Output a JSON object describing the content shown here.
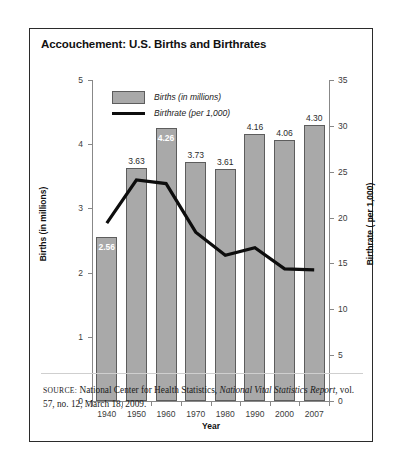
{
  "figure": {
    "title": "Accouchement: U.S. Births and Birthrates",
    "source_kicker": "SOURCE:",
    "source_text_1": " National Center for Health Statistics, ",
    "source_italic": "National Vital Statistics Report",
    "source_text_2": ", vol. 57, no. 12, March 18, 2009."
  },
  "legend": {
    "bars_label": "Births (in millions)",
    "line_label": "Birthrate (per 1,000)",
    "bar_color": "#a9a9a9",
    "bar_border_color": "#5d5d5d",
    "line_color": "#0d0d0d"
  },
  "chart_data": {
    "type": "bar",
    "title": "Accouchement: U.S. Births and Birthrates",
    "xlabel": "Year",
    "ylabel": "Births (in millions)",
    "y2label": "Birthrate ( per 1,000)",
    "categories": [
      "1940",
      "1950",
      "1960",
      "1970",
      "1980",
      "1990",
      "2000",
      "2007"
    ],
    "ylim": [
      0,
      5
    ],
    "y2lim": [
      0,
      35
    ],
    "yticks": [
      "0",
      "1",
      "2",
      "3",
      "4",
      "5"
    ],
    "y2ticks": [
      "0",
      "5",
      "10",
      "15",
      "20",
      "25",
      "30",
      "35"
    ],
    "grid": false,
    "legend_position": "upper-left",
    "series": [
      {
        "name": "Births (in millions)",
        "type": "bar",
        "axis": "left",
        "values": [
          2.56,
          3.63,
          4.26,
          3.73,
          3.61,
          4.16,
          4.06,
          4.3
        ],
        "labels": [
          "2.56",
          "3.63",
          "4.26",
          "3.73",
          "3.61",
          "4.16",
          "4.06",
          "4.30"
        ],
        "label_placement": [
          "inside",
          "above",
          "inside",
          "above",
          "above",
          "above",
          "above",
          "above"
        ]
      },
      {
        "name": "Birthrate (per 1,000)",
        "type": "line",
        "axis": "right",
        "values": [
          19.4,
          24.1,
          23.7,
          18.4,
          15.9,
          16.7,
          14.4,
          14.3
        ]
      }
    ]
  }
}
